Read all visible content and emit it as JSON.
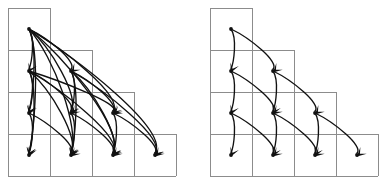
{
  "figure": {
    "background_color": "#ffffff",
    "grid_color": "#8c8c8c",
    "edge_color": "#111111",
    "width": 380,
    "height": 183,
    "caption": ""
  },
  "diagrams": [
    {
      "id": "left-diagram",
      "name": "dense-staircase-graph",
      "label": "",
      "origin_x": 8,
      "origin_y": 8,
      "cell_size": 42,
      "rows": 4,
      "row_widths": [
        1,
        2,
        3,
        4
      ],
      "edge_pattern": "complete-downward",
      "edge_count": 20,
      "nodes": [
        {
          "id": "n0-0",
          "row": 0,
          "col": 0,
          "cx": 29,
          "cy": 29
        },
        {
          "id": "n1-0",
          "row": 1,
          "col": 0,
          "cx": 29,
          "cy": 71
        },
        {
          "id": "n1-1",
          "row": 1,
          "col": 1,
          "cx": 71,
          "cy": 71
        },
        {
          "id": "n2-0",
          "row": 2,
          "col": 0,
          "cx": 29,
          "cy": 113
        },
        {
          "id": "n2-1",
          "row": 2,
          "col": 1,
          "cx": 71,
          "cy": 113
        },
        {
          "id": "n2-2",
          "row": 2,
          "col": 2,
          "cx": 113,
          "cy": 113
        },
        {
          "id": "n3-0",
          "row": 3,
          "col": 0,
          "cx": 29,
          "cy": 155
        },
        {
          "id": "n3-1",
          "row": 3,
          "col": 1,
          "cx": 71,
          "cy": 155
        },
        {
          "id": "n3-2",
          "row": 3,
          "col": 2,
          "cx": 113,
          "cy": 155
        },
        {
          "id": "n3-3",
          "row": 3,
          "col": 3,
          "cx": 155,
          "cy": 155
        }
      ],
      "edges": [
        {
          "from": "n0-0",
          "to": "n1-0"
        },
        {
          "from": "n0-0",
          "to": "n1-1"
        },
        {
          "from": "n0-0",
          "to": "n2-0"
        },
        {
          "from": "n0-0",
          "to": "n2-1"
        },
        {
          "from": "n0-0",
          "to": "n2-2"
        },
        {
          "from": "n0-0",
          "to": "n3-0"
        },
        {
          "from": "n0-0",
          "to": "n3-1"
        },
        {
          "from": "n0-0",
          "to": "n3-2"
        },
        {
          "from": "n0-0",
          "to": "n3-3"
        },
        {
          "from": "n1-0",
          "to": "n2-0"
        },
        {
          "from": "n1-0",
          "to": "n2-1"
        },
        {
          "from": "n1-0",
          "to": "n2-2"
        },
        {
          "from": "n1-0",
          "to": "n3-0"
        },
        {
          "from": "n1-0",
          "to": "n3-1"
        },
        {
          "from": "n1-0",
          "to": "n3-2"
        },
        {
          "from": "n1-1",
          "to": "n2-1"
        },
        {
          "from": "n1-1",
          "to": "n2-2"
        },
        {
          "from": "n1-1",
          "to": "n3-1"
        },
        {
          "from": "n1-1",
          "to": "n3-2"
        },
        {
          "from": "n1-1",
          "to": "n3-3"
        },
        {
          "from": "n2-0",
          "to": "n3-0"
        },
        {
          "from": "n2-0",
          "to": "n3-1"
        },
        {
          "from": "n2-1",
          "to": "n3-1"
        },
        {
          "from": "n2-1",
          "to": "n3-2"
        },
        {
          "from": "n2-2",
          "to": "n3-2"
        },
        {
          "from": "n2-2",
          "to": "n3-3"
        }
      ]
    },
    {
      "id": "right-diagram",
      "name": "sparse-staircase-graph",
      "label": "",
      "origin_x": 210,
      "origin_y": 8,
      "cell_size": 42,
      "rows": 4,
      "row_widths": [
        1,
        2,
        3,
        4
      ],
      "edge_pattern": "down-and-diagonal",
      "edge_count": 12,
      "nodes": [
        {
          "id": "m0-0",
          "row": 0,
          "col": 0,
          "cx": 231,
          "cy": 29
        },
        {
          "id": "m1-0",
          "row": 1,
          "col": 0,
          "cx": 231,
          "cy": 71
        },
        {
          "id": "m1-1",
          "row": 1,
          "col": 1,
          "cx": 273,
          "cy": 71
        },
        {
          "id": "m2-0",
          "row": 2,
          "col": 0,
          "cx": 231,
          "cy": 113
        },
        {
          "id": "m2-1",
          "row": 2,
          "col": 1,
          "cx": 273,
          "cy": 113
        },
        {
          "id": "m2-2",
          "row": 2,
          "col": 2,
          "cx": 315,
          "cy": 113
        },
        {
          "id": "m3-0",
          "row": 3,
          "col": 0,
          "cx": 231,
          "cy": 155
        },
        {
          "id": "m3-1",
          "row": 3,
          "col": 1,
          "cx": 273,
          "cy": 155
        },
        {
          "id": "m3-2",
          "row": 3,
          "col": 2,
          "cx": 315,
          "cy": 155
        },
        {
          "id": "m3-3",
          "row": 3,
          "col": 3,
          "cx": 357,
          "cy": 155
        }
      ],
      "edges": [
        {
          "from": "m0-0",
          "to": "m1-0"
        },
        {
          "from": "m0-0",
          "to": "m1-1"
        },
        {
          "from": "m1-0",
          "to": "m2-0"
        },
        {
          "from": "m1-0",
          "to": "m2-1"
        },
        {
          "from": "m1-1",
          "to": "m2-1"
        },
        {
          "from": "m1-1",
          "to": "m2-2"
        },
        {
          "from": "m2-0",
          "to": "m3-0"
        },
        {
          "from": "m2-0",
          "to": "m3-1"
        },
        {
          "from": "m2-1",
          "to": "m3-1"
        },
        {
          "from": "m2-1",
          "to": "m3-2"
        },
        {
          "from": "m2-2",
          "to": "m3-2"
        },
        {
          "from": "m2-2",
          "to": "m3-3"
        }
      ]
    }
  ]
}
